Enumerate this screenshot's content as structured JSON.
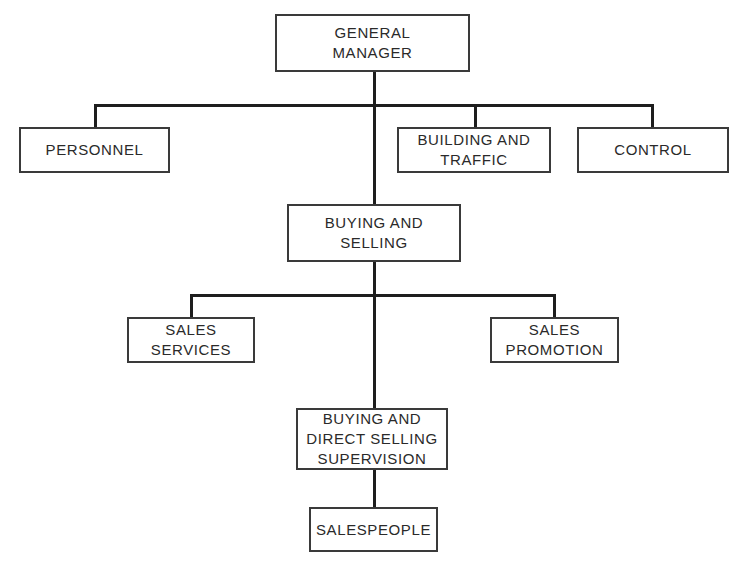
{
  "diagram": {
    "type": "organization-chart",
    "nodes": {
      "general_manager": "GENERAL\nMANAGER",
      "personnel": "PERSONNEL",
      "building_traffic": "BUILDING AND\nTRAFFIC",
      "control": "CONTROL",
      "buying_selling": "BUYING AND\nSELLING",
      "sales_services": "SALES\nSERVICES",
      "sales_promotion": "SALES\nPROMOTION",
      "buying_direct_selling_supervision": "BUYING AND\nDIRECT SELLING\nSUPERVISION",
      "salespeople": "SALESPEOPLE"
    },
    "edges": [
      [
        "general_manager",
        "personnel"
      ],
      [
        "general_manager",
        "building_traffic"
      ],
      [
        "general_manager",
        "control"
      ],
      [
        "general_manager",
        "buying_selling"
      ],
      [
        "buying_selling",
        "sales_services"
      ],
      [
        "buying_selling",
        "sales_promotion"
      ],
      [
        "buying_selling",
        "buying_direct_selling_supervision"
      ],
      [
        "buying_direct_selling_supervision",
        "salespeople"
      ]
    ]
  }
}
